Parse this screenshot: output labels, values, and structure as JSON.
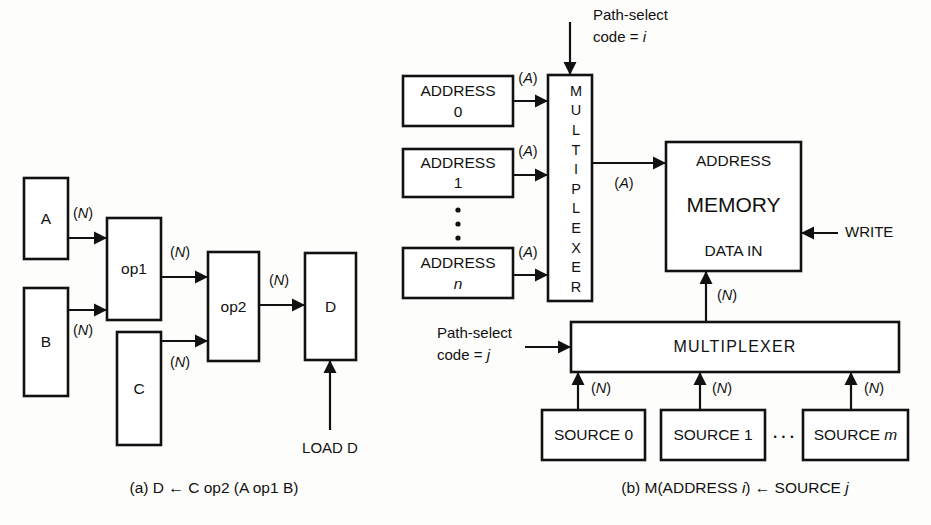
{
  "figure": {
    "background_color": "#fdfdfb",
    "line_color": "#111111",
    "panels": [
      {
        "id": "panel-a",
        "caption": "(a) D ← C op2 (A op1 B)",
        "caption_x": 214,
        "caption_y": 489
      },
      {
        "id": "panel-b",
        "caption_prefix": "(b) M(ADDRESS ",
        "caption_i": "i",
        "caption_mid": ") ← SOURCE ",
        "caption_j": "j",
        "caption_x": 735,
        "caption_y": 489
      }
    ]
  },
  "panel_a": {
    "boxes": [
      {
        "name": "operand-a",
        "label": "A",
        "x": 24,
        "y": 178,
        "w": 44,
        "h": 81,
        "size": "md"
      },
      {
        "name": "operand-b",
        "label": "B",
        "x": 24,
        "y": 288,
        "w": 44,
        "h": 108,
        "size": "md"
      },
      {
        "name": "operand-c",
        "label": "C",
        "x": 117,
        "y": 332,
        "w": 44,
        "h": 113,
        "size": "md"
      },
      {
        "name": "operator-1",
        "label": "op1",
        "x": 107,
        "y": 218,
        "w": 54,
        "h": 102,
        "size": "md"
      },
      {
        "name": "operator-2",
        "label": "op2",
        "x": 208,
        "y": 252,
        "w": 51,
        "h": 109,
        "size": "md"
      },
      {
        "name": "result-d",
        "label": "D",
        "x": 305,
        "y": 253,
        "w": 51,
        "h": 107,
        "size": "md"
      }
    ],
    "wires": [
      {
        "name": "wire-a-to-op1",
        "from": "A",
        "to": "op1",
        "x1": 68,
        "y1": 238,
        "x2": 107,
        "y2": 238,
        "dir": "right",
        "label": "(N)",
        "lx": 83,
        "ly": 214
      },
      {
        "name": "wire-b-to-op1",
        "from": "B",
        "to": "op1",
        "x1": 68,
        "y1": 310,
        "x2": 107,
        "y2": 310,
        "dir": "right",
        "label": "(N)",
        "lx": 83,
        "ly": 331
      },
      {
        "name": "wire-op1-to-op2",
        "from": "op1",
        "to": "op2",
        "x1": 161,
        "y1": 277,
        "x2": 208,
        "y2": 277,
        "dir": "right",
        "label": "(N)",
        "lx": 180,
        "ly": 253
      },
      {
        "name": "wire-c-to-op2",
        "from": "C",
        "to": "op2",
        "x1": 161,
        "y1": 341,
        "x2": 208,
        "y2": 341,
        "dir": "right",
        "label": "(N)",
        "lx": 180,
        "ly": 363
      },
      {
        "name": "wire-op2-to-d",
        "from": "op2",
        "to": "D",
        "x1": 259,
        "y1": 305,
        "x2": 305,
        "y2": 305,
        "dir": "right",
        "label": "(N)",
        "lx": 279,
        "ly": 281
      },
      {
        "name": "wire-load-d",
        "from": "LOAD D",
        "to": "D",
        "x1": 330,
        "y1": 430,
        "x2": 330,
        "y2": 360,
        "dir": "up",
        "label": "",
        "lx": 0,
        "ly": 0
      }
    ],
    "signals": [
      {
        "name": "load-d-label",
        "label": "LOAD D",
        "x": 330,
        "y": 449
      }
    ]
  },
  "panel_b": {
    "boxes": [
      {
        "name": "address-0",
        "line1": "ADDRESS",
        "line2": "0",
        "italic2": false,
        "x": 403,
        "y": 76,
        "w": 110,
        "h": 50
      },
      {
        "name": "address-1",
        "line1": "ADDRESS",
        "line2": "1",
        "italic2": false,
        "x": 403,
        "y": 149,
        "w": 110,
        "h": 48
      },
      {
        "name": "address-n",
        "line1": "ADDRESS",
        "line2": "n",
        "italic2": true,
        "x": 403,
        "y": 248,
        "w": 110,
        "h": 50
      }
    ],
    "vertical_mux": {
      "name": "address-multiplexer",
      "label": "MULTIPLEXER",
      "x": 548,
      "y": 75,
      "w": 44,
      "h": 226
    },
    "memory": {
      "name": "memory-block",
      "x": 666,
      "y": 142,
      "w": 135,
      "h": 129,
      "label_address": "ADDRESS",
      "label_main": "MEMORY",
      "label_data_in": "DATA IN"
    },
    "horizontal_mux": {
      "name": "source-multiplexer",
      "label": "MULTIPLEXER",
      "x": 571,
      "y": 322,
      "w": 328,
      "h": 50
    },
    "sources": [
      {
        "name": "source-0",
        "prefix": "SOURCE ",
        "index": "0",
        "italic": false,
        "x": 542,
        "y": 410,
        "w": 103,
        "h": 50
      },
      {
        "name": "source-1",
        "prefix": "SOURCE ",
        "index": "1",
        "italic": false,
        "x": 661,
        "y": 410,
        "w": 104,
        "h": 50
      },
      {
        "name": "source-m",
        "prefix": "SOURCE ",
        "index": "m",
        "italic": true,
        "x": 803,
        "y": 410,
        "w": 105,
        "h": 50
      }
    ],
    "path_select_top": {
      "name": "path-select-code-i",
      "line1": "Path-select",
      "line2_prefix": "code = ",
      "line2_var": "i",
      "text_x": 593,
      "text_y1": 16,
      "text_y2": 38,
      "arrow_x": 570,
      "arrow_y1": 22,
      "arrow_y2": 75
    },
    "path_select_bottom": {
      "name": "path-select-code-j",
      "line1": "Path-select",
      "line2_prefix": "code = ",
      "line2_var": "j",
      "text_x": 437,
      "text_y1": 334,
      "text_y2": 356,
      "arrow_x1": 525,
      "arrow_x2": 571,
      "arrow_y": 347
    },
    "write_signal": {
      "name": "write-signal",
      "label": "WRITE",
      "text_x": 845,
      "text_y": 233,
      "arrow_x1": 838,
      "arrow_x2": 801,
      "arrow_y": 233
    },
    "wires": [
      {
        "name": "wire-address0-to-mux",
        "x1": 513,
        "y1": 101,
        "x2": 548,
        "y2": 101,
        "dir": "right",
        "label": "(A)",
        "lx": 528,
        "ly": 79
      },
      {
        "name": "wire-address1-to-mux",
        "x1": 513,
        "y1": 175,
        "x2": 548,
        "y2": 175,
        "dir": "right",
        "label": "(A)",
        "lx": 528,
        "ly": 152
      },
      {
        "name": "wire-addressn-to-mux",
        "x1": 513,
        "y1": 275,
        "x2": 548,
        "y2": 275,
        "dir": "right",
        "label": "(A)",
        "lx": 528,
        "ly": 253
      },
      {
        "name": "wire-mux-to-memory",
        "x1": 592,
        "y1": 163,
        "x2": 666,
        "y2": 163,
        "dir": "right",
        "label": "(A)",
        "lx": 624,
        "ly": 184
      },
      {
        "name": "wire-mux-to-datain",
        "x1": 706,
        "y1": 322,
        "x2": 706,
        "y2": 271,
        "dir": "up",
        "label": "(N)",
        "lx": 727,
        "ly": 296
      },
      {
        "name": "wire-source0-to-mux",
        "x1": 578,
        "y1": 410,
        "x2": 578,
        "y2": 372,
        "dir": "up",
        "label": "(N)",
        "lx": 601,
        "ly": 389
      },
      {
        "name": "wire-source1-to-mux",
        "x1": 700,
        "y1": 410,
        "x2": 700,
        "y2": 372,
        "dir": "up",
        "label": "(N)",
        "lx": 722,
        "ly": 389
      },
      {
        "name": "wire-sourcem-to-mux",
        "x1": 851,
        "y1": 410,
        "x2": 851,
        "y2": 372,
        "dir": "up",
        "label": "(N)",
        "lx": 874,
        "ly": 389
      }
    ],
    "vertical_ellipsis": {
      "name": "address-ellipsis",
      "x": 458,
      "ys": [
        210,
        224,
        238
      ]
    },
    "horizontal_ellipsis": {
      "name": "source-ellipsis",
      "label": "···",
      "x": 784,
      "y": 437
    }
  }
}
